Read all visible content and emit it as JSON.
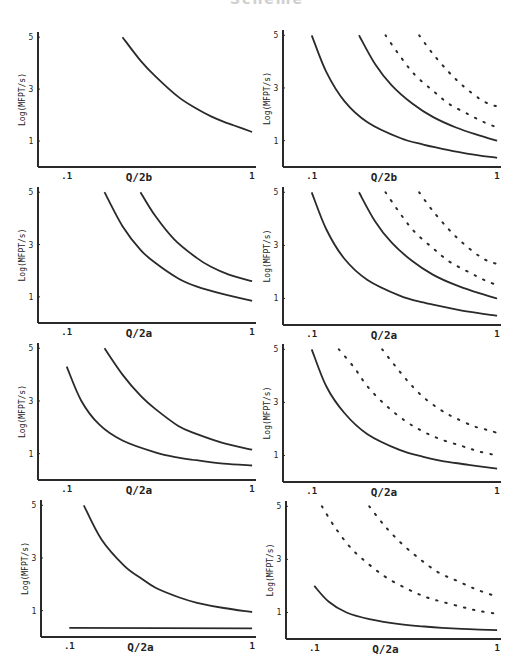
{
  "figure": {
    "header_text": "Scheme",
    "ink_color": "#2a2a2a",
    "y_axis_label": "Log(MFPT/s)",
    "y_ticks": [
      "1",
      "3",
      "5"
    ],
    "x_ticks": [
      ".1",
      "1"
    ]
  },
  "chart_data": [
    {
      "panel": "row1-left",
      "type": "line",
      "xlabel": "Q/2b",
      "ylabel": "Log(MFPT/s)",
      "xscale": "log",
      "xlim": [
        0.07,
        1.05
      ],
      "ylim": [
        0,
        5.2
      ],
      "series": [
        {
          "name": "curve-1",
          "style": "solid",
          "x": [
            0.2,
            0.25,
            0.3,
            0.4,
            0.5,
            0.6,
            0.7,
            0.8,
            1.0
          ],
          "y": [
            5.0,
            4.1,
            3.5,
            2.7,
            2.25,
            1.95,
            1.75,
            1.6,
            1.35
          ]
        }
      ]
    },
    {
      "panel": "row1-right",
      "type": "line",
      "xlabel": "Q/2b",
      "ylabel": "Log(MFPT/s)",
      "xscale": "log",
      "xlim": [
        0.07,
        1.05
      ],
      "ylim": [
        0,
        5.2
      ],
      "series": [
        {
          "name": "curve-1",
          "style": "solid",
          "x": [
            0.1,
            0.12,
            0.15,
            0.2,
            0.3,
            0.4,
            0.5,
            0.7,
            1.0
          ],
          "y": [
            5.0,
            3.6,
            2.5,
            1.7,
            1.1,
            0.85,
            0.7,
            0.5,
            0.35
          ]
        },
        {
          "name": "curve-2",
          "style": "solid",
          "x": [
            0.18,
            0.22,
            0.27,
            0.35,
            0.45,
            0.6,
            0.8,
            1.0
          ],
          "y": [
            5.0,
            3.9,
            3.1,
            2.4,
            1.9,
            1.5,
            1.2,
            1.0
          ]
        },
        {
          "name": "curve-3",
          "style": "dotted",
          "x": [
            0.25,
            0.3,
            0.36,
            0.45,
            0.55,
            0.7,
            0.85,
            1.0
          ],
          "y": [
            5.0,
            4.2,
            3.5,
            2.9,
            2.4,
            2.0,
            1.7,
            1.5
          ]
        },
        {
          "name": "curve-4",
          "style": "dotted",
          "x": [
            0.38,
            0.45,
            0.55,
            0.65,
            0.8,
            0.9,
            1.0
          ],
          "y": [
            5.0,
            4.3,
            3.6,
            3.1,
            2.6,
            2.4,
            2.3
          ]
        }
      ]
    },
    {
      "panel": "row2-left",
      "type": "line",
      "xlabel": "Q/2a",
      "ylabel": "Log(MFPT/s)",
      "xscale": "log",
      "xlim": [
        0.07,
        1.05
      ],
      "ylim": [
        0,
        5.2
      ],
      "series": [
        {
          "name": "curve-1",
          "style": "solid",
          "x": [
            0.16,
            0.2,
            0.25,
            0.3,
            0.4,
            0.5,
            0.7,
            1.0
          ],
          "y": [
            5.0,
            3.7,
            2.8,
            2.3,
            1.7,
            1.4,
            1.1,
            0.85
          ]
        },
        {
          "name": "curve-2",
          "style": "solid",
          "x": [
            0.25,
            0.3,
            0.38,
            0.5,
            0.6,
            0.75,
            1.0
          ],
          "y": [
            5.0,
            4.1,
            3.2,
            2.5,
            2.15,
            1.85,
            1.6
          ]
        }
      ]
    },
    {
      "panel": "row2-right",
      "type": "line",
      "xlabel": "Q/2a",
      "ylabel": "Log(MFPT/s)",
      "xscale": "log",
      "xlim": [
        0.07,
        1.05
      ],
      "ylim": [
        0,
        5.2
      ],
      "series": [
        {
          "name": "curve-1",
          "style": "solid",
          "x": [
            0.1,
            0.12,
            0.15,
            0.2,
            0.3,
            0.4,
            0.5,
            0.7,
            1.0
          ],
          "y": [
            5.0,
            3.6,
            2.5,
            1.7,
            1.1,
            0.85,
            0.7,
            0.5,
            0.35
          ]
        },
        {
          "name": "curve-2",
          "style": "solid",
          "x": [
            0.18,
            0.22,
            0.27,
            0.35,
            0.45,
            0.6,
            0.8,
            1.0
          ],
          "y": [
            5.0,
            3.9,
            3.1,
            2.4,
            1.9,
            1.5,
            1.2,
            1.0
          ]
        },
        {
          "name": "curve-3",
          "style": "dotted",
          "x": [
            0.25,
            0.3,
            0.36,
            0.45,
            0.55,
            0.7,
            0.85,
            1.0
          ],
          "y": [
            5.0,
            4.2,
            3.5,
            2.9,
            2.4,
            2.0,
            1.7,
            1.5
          ]
        },
        {
          "name": "curve-4",
          "style": "dotted",
          "x": [
            0.38,
            0.45,
            0.55,
            0.65,
            0.8,
            0.9,
            1.0
          ],
          "y": [
            5.0,
            4.3,
            3.6,
            3.1,
            2.6,
            2.4,
            2.3
          ]
        }
      ]
    },
    {
      "panel": "row3-left",
      "type": "line",
      "xlabel": "Q/2a",
      "ylabel": "Log(MFPT/s)",
      "xscale": "log",
      "xlim": [
        0.07,
        1.05
      ],
      "ylim": [
        0,
        5.2
      ],
      "series": [
        {
          "name": "curve-1",
          "style": "solid",
          "x": [
            0.1,
            0.12,
            0.15,
            0.2,
            0.3,
            0.4,
            0.5,
            0.7,
            1.0
          ],
          "y": [
            4.3,
            3.0,
            2.1,
            1.5,
            1.05,
            0.85,
            0.75,
            0.62,
            0.55
          ]
        },
        {
          "name": "curve-2",
          "style": "solid",
          "x": [
            0.16,
            0.2,
            0.25,
            0.3,
            0.4,
            0.5,
            0.7,
            1.0
          ],
          "y": [
            5.0,
            4.0,
            3.2,
            2.7,
            2.05,
            1.75,
            1.4,
            1.15
          ]
        }
      ]
    },
    {
      "panel": "row3-right",
      "type": "line",
      "xlabel": "Q/2a",
      "ylabel": "Log(MFPT/s)",
      "xscale": "log",
      "xlim": [
        0.07,
        1.05
      ],
      "ylim": [
        0,
        5.2
      ],
      "series": [
        {
          "name": "curve-1",
          "style": "solid",
          "x": [
            0.1,
            0.12,
            0.15,
            0.2,
            0.3,
            0.4,
            0.5,
            0.7,
            1.0
          ],
          "y": [
            5.0,
            3.6,
            2.6,
            1.8,
            1.2,
            0.95,
            0.8,
            0.65,
            0.5
          ]
        },
        {
          "name": "curve-2",
          "style": "dotted",
          "x": [
            0.14,
            0.17,
            0.2,
            0.25,
            0.32,
            0.4,
            0.5,
            0.65,
            0.8,
            1.0
          ],
          "y": [
            5.0,
            4.3,
            3.6,
            2.9,
            2.3,
            1.9,
            1.6,
            1.35,
            1.15,
            1.0
          ]
        },
        {
          "name": "curve-3",
          "style": "dotted",
          "x": [
            0.24,
            0.28,
            0.33,
            0.4,
            0.5,
            0.6,
            0.75,
            0.9,
            1.0
          ],
          "y": [
            5.0,
            4.4,
            3.8,
            3.2,
            2.7,
            2.4,
            2.1,
            1.95,
            1.85
          ]
        }
      ]
    },
    {
      "panel": "row4-left",
      "type": "line",
      "xlabel": "Q/2a",
      "ylabel": "Log(MFPT/s)",
      "xscale": "log",
      "xlim": [
        0.07,
        1.05
      ],
      "ylim": [
        0,
        5.2
      ],
      "series": [
        {
          "name": "curve-1",
          "style": "solid",
          "x": [
            0.12,
            0.15,
            0.2,
            0.25,
            0.3,
            0.4,
            0.5,
            0.7,
            1.0
          ],
          "y": [
            5.0,
            3.7,
            2.7,
            2.2,
            1.85,
            1.5,
            1.3,
            1.1,
            0.95
          ]
        },
        {
          "name": "baseline",
          "style": "solid",
          "x": [
            0.1,
            1.0
          ],
          "y": [
            0.35,
            0.33
          ]
        }
      ]
    },
    {
      "panel": "row4-right",
      "type": "line",
      "xlabel": "Q/2a",
      "ylabel": "Log(MFPT/s)",
      "xscale": "log",
      "xlim": [
        0.07,
        1.05
      ],
      "ylim": [
        0,
        5.2
      ],
      "series": [
        {
          "name": "curve-1",
          "style": "solid",
          "x": [
            0.1,
            0.12,
            0.15,
            0.2,
            0.3,
            0.4,
            0.5,
            0.7,
            1.0
          ],
          "y": [
            2.0,
            1.4,
            1.0,
            0.75,
            0.55,
            0.47,
            0.42,
            0.37,
            0.33
          ]
        },
        {
          "name": "curve-2",
          "style": "dotted",
          "x": [
            0.11,
            0.13,
            0.16,
            0.2,
            0.25,
            0.32,
            0.4,
            0.5,
            0.65,
            0.8,
            1.0
          ],
          "y": [
            5.0,
            4.2,
            3.4,
            2.8,
            2.3,
            1.9,
            1.6,
            1.4,
            1.2,
            1.05,
            0.95
          ]
        },
        {
          "name": "curve-3",
          "style": "dotted",
          "x": [
            0.2,
            0.24,
            0.3,
            0.38,
            0.48,
            0.6,
            0.75,
            0.9,
            1.0
          ],
          "y": [
            5.0,
            4.3,
            3.6,
            3.0,
            2.5,
            2.2,
            1.9,
            1.7,
            1.6
          ]
        }
      ]
    }
  ]
}
